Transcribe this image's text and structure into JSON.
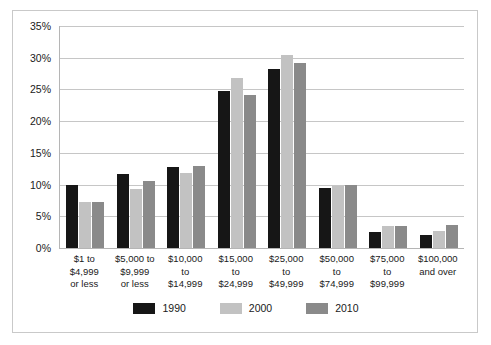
{
  "chart_data": {
    "type": "bar",
    "title": "",
    "subtitle": "",
    "xlabel": "",
    "ylabel": "",
    "ylim": [
      0,
      35
    ],
    "grid": true,
    "legend_position": "bottom",
    "y_ticks": [
      "0%",
      "5%",
      "10%",
      "15%",
      "20%",
      "25%",
      "30%",
      "35%"
    ],
    "y_tick_values": [
      0,
      5,
      10,
      15,
      20,
      25,
      30,
      35
    ],
    "categories": [
      "$1 to $4,999 or less",
      "$5,000 to $9,999 or less",
      "$10,000 to $14,999",
      "$15,000 to $24,999",
      "$25,000 to $49,999",
      "$50,000 to $74,999",
      "$75,000 to $99,999",
      "$100,000 and over"
    ],
    "category_lines": [
      [
        "$1 to",
        "$4,999",
        "or less"
      ],
      [
        "$5,000 to",
        "$9,999",
        "or less"
      ],
      [
        "$10,000",
        "to",
        "$14,999"
      ],
      [
        "$15,000",
        "to",
        "$24,999"
      ],
      [
        "$25,000",
        "to",
        "$49,999"
      ],
      [
        "$50,000",
        "to",
        "$74,999"
      ],
      [
        "$75,000",
        "to",
        "$99,999"
      ],
      [
        "$100,000",
        "and over",
        ""
      ]
    ],
    "series": [
      {
        "name": "1990",
        "color": "#161616",
        "values": [
          10.0,
          11.6,
          12.8,
          24.8,
          28.2,
          9.4,
          2.6,
          2.0
        ]
      },
      {
        "name": "2000",
        "color": "#c2c2c2",
        "values": [
          7.2,
          9.3,
          11.9,
          26.8,
          30.5,
          9.7,
          3.5,
          2.7
        ]
      },
      {
        "name": "2010",
        "color": "#8a8a8a",
        "values": [
          7.3,
          10.6,
          12.9,
          24.2,
          29.1,
          10.0,
          3.5,
          3.7
        ]
      }
    ]
  },
  "legend": {
    "items": [
      {
        "label": "1990",
        "color": "#161616"
      },
      {
        "label": "2000",
        "color": "#c2c2c2"
      },
      {
        "label": "2010",
        "color": "#8a8a8a"
      }
    ]
  }
}
